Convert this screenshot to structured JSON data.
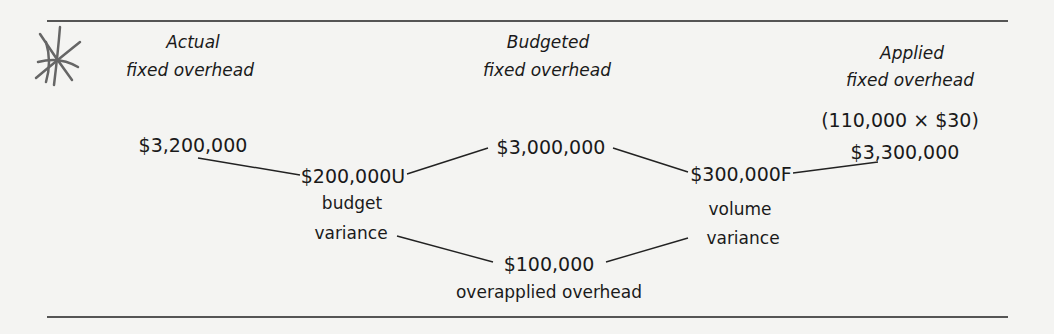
{
  "diagram": {
    "columns": [
      {
        "heading_line1": "Actual",
        "heading_line2": "fixed overhead",
        "amount": "$3,200,000"
      },
      {
        "heading_line1": "Budgeted",
        "heading_line2": "fixed overhead",
        "amount": "$3,000,000"
      },
      {
        "heading_line1": "Applied",
        "heading_line2": "fixed overhead",
        "formula": "(110,000 × $30)",
        "amount": "$3,300,000"
      }
    ],
    "variances": [
      {
        "amount": "$200,000U",
        "label_line1": "budget",
        "label_line2": "variance"
      },
      {
        "amount": "$300,000F",
        "label_line1": "volume",
        "label_line2": "variance"
      }
    ],
    "total": {
      "amount": "$100,000",
      "label": "overapplied overhead"
    },
    "colors": {
      "background": "#f4f4f2",
      "ink": "#1a1a1a",
      "rule": "#555555",
      "scribble": "#666666"
    }
  }
}
